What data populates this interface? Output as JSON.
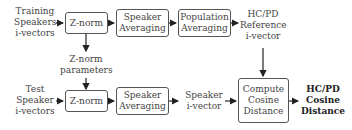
{
  "diagram": {
    "inputs": {
      "training": "Training Speakers i-vectors",
      "test": "Test Speaker i-vectors"
    },
    "boxes": {
      "znorm_top": "Z-norm",
      "spkavg_top": "Speaker Averaging",
      "popavg": "Population Averaging",
      "znorm_bottom": "Z-norm",
      "spkavg_bottom": "Speaker Averaging",
      "cosine": "Compute Cosine Distance"
    },
    "labels": {
      "znorm_params": "Z-norm parameters",
      "reference": "HC/PD Reference i-vector",
      "speaker_ivector": "Speaker i-vector",
      "output": "HC/PD Cosine Distance"
    }
  }
}
